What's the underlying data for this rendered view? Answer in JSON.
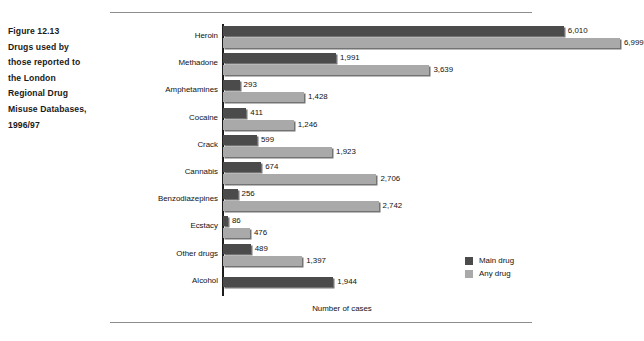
{
  "caption": {
    "lines": [
      "Figure 12.13",
      "Drugs used by",
      "those reported to",
      "the London",
      "Regional Drug",
      "Misuse Databases,",
      "1996/97"
    ]
  },
  "legend": {
    "position": "bottom-right",
    "items": [
      {
        "label": "Main drug",
        "color": "#4b4b4b"
      },
      {
        "label": "Any drug",
        "color": "#a9a9a9"
      }
    ]
  },
  "chart_data": {
    "type": "bar",
    "orientation": "horizontal",
    "xlabel": "Number of cases",
    "ylabel": "",
    "xlim": [
      0,
      7000
    ],
    "grid": false,
    "legend_position": "bottom-right",
    "categories": [
      "Heroin",
      "Methadone",
      "Amphetamines",
      "Cocaine",
      "Crack",
      "Cannabis",
      "Benzodiazepines",
      "Ecstacy",
      "Other drugs",
      "Alcohol"
    ],
    "series": [
      {
        "name": "Main drug",
        "color": "#4b4b4b",
        "values": [
          6010,
          1991,
          293,
          411,
          599,
          674,
          256,
          86,
          489,
          1944
        ],
        "labels": [
          "6,010",
          "1,991",
          "293",
          "411",
          "599",
          "674",
          "256",
          "86",
          "489",
          "1,944"
        ]
      },
      {
        "name": "Any drug",
        "color": "#a9a9a9",
        "values": [
          6999,
          3639,
          1428,
          1246,
          1923,
          2706,
          2742,
          476,
          1397,
          null
        ],
        "labels": [
          "6,999",
          "3,639",
          "1,428",
          "1,246",
          "1,923",
          "2,706",
          "2,742",
          "476",
          "1,397",
          null
        ]
      }
    ]
  }
}
